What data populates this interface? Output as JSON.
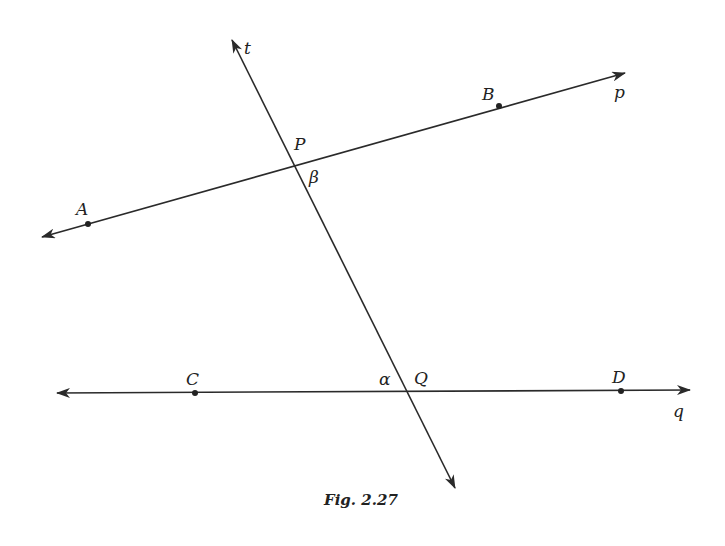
{
  "figure": {
    "caption": "Fig. 2.27",
    "lines": [
      {
        "name": "t",
        "from": [
          232,
          40
        ],
        "to": [
          455,
          488
        ],
        "arrows": "both"
      },
      {
        "name": "p",
        "from": [
          42,
          237
        ],
        "to": [
          625,
          73
        ],
        "arrows": "both"
      },
      {
        "name": "q",
        "from": [
          57,
          393
        ],
        "to": [
          690,
          390
        ],
        "arrows": "both"
      }
    ],
    "points": [
      {
        "name": "A",
        "x": 88,
        "y": 224
      },
      {
        "name": "B",
        "x": 499,
        "y": 106
      },
      {
        "name": "C",
        "x": 195,
        "y": 393
      },
      {
        "name": "D",
        "x": 621,
        "y": 391
      },
      {
        "name": "P",
        "x": 291,
        "y": 168
      },
      {
        "name": "Q",
        "x": 409,
        "y": 392
      }
    ],
    "labels": {
      "t": "t",
      "p": "p",
      "q": "q",
      "A": "A",
      "B": "B",
      "C": "C",
      "D": "D",
      "P": "P",
      "Q": "Q",
      "alpha": "α",
      "beta": "β"
    },
    "stroke_color": "#2a2a2a"
  }
}
